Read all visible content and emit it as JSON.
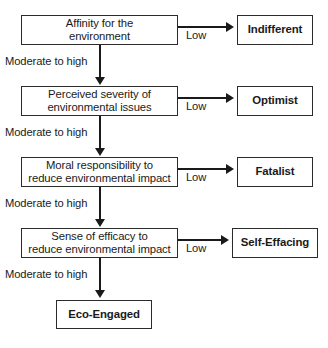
{
  "diagram": {
    "colors": {
      "line": "#1a1a1a",
      "box_border": "#2b2b2b",
      "background": "#ffffff",
      "text": "#1a1a1a"
    },
    "stages": [
      {
        "id": "affinity",
        "label": "Affinity for the\nenvironment",
        "low_label": "Low",
        "low_outcome": "Indifferent",
        "high_label": "Moderate to high"
      },
      {
        "id": "severity",
        "label": "Perceived severity of\nenvironmental issues",
        "low_label": "Low",
        "low_outcome": "Optimist",
        "high_label": "Moderate to high"
      },
      {
        "id": "responsibility",
        "label": "Moral responsibility to\nreduce environmental impact",
        "low_label": "Low",
        "low_outcome": "Fatalist",
        "high_label": "Moderate to high"
      },
      {
        "id": "efficacy",
        "label": "Sense of efficacy to\nreduce environmental impact",
        "low_label": "Low",
        "low_outcome": "Self-Effacing",
        "high_label": "Moderate to high"
      }
    ],
    "final_outcome": {
      "id": "eco-engaged",
      "label": "Eco-Engaged"
    }
  }
}
